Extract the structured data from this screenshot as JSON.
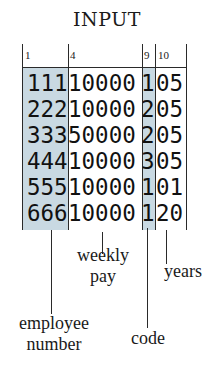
{
  "title": "INPUT",
  "column_numbers": [
    "1",
    "4",
    "9",
    "10"
  ],
  "records": [
    {
      "employee_number": "111",
      "weekly_pay": "10000",
      "code": "1",
      "years": "05"
    },
    {
      "employee_number": "222",
      "weekly_pay": "10000",
      "code": "2",
      "years": "05"
    },
    {
      "employee_number": "333",
      "weekly_pay": "50000",
      "code": "2",
      "years": "05"
    },
    {
      "employee_number": "444",
      "weekly_pay": "10000",
      "code": "3",
      "years": "05"
    },
    {
      "employee_number": "555",
      "weekly_pay": "10000",
      "code": "1",
      "years": "01"
    },
    {
      "employee_number": "666",
      "weekly_pay": "10000",
      "code": "1",
      "years": "20"
    }
  ],
  "labels": {
    "employee_number": "employee\nnumber",
    "weekly_pay": "weekly\npay",
    "code": "code",
    "years": "years"
  },
  "colors": {
    "shade": "#c9d9e2",
    "lines": "#2a2a2a"
  }
}
